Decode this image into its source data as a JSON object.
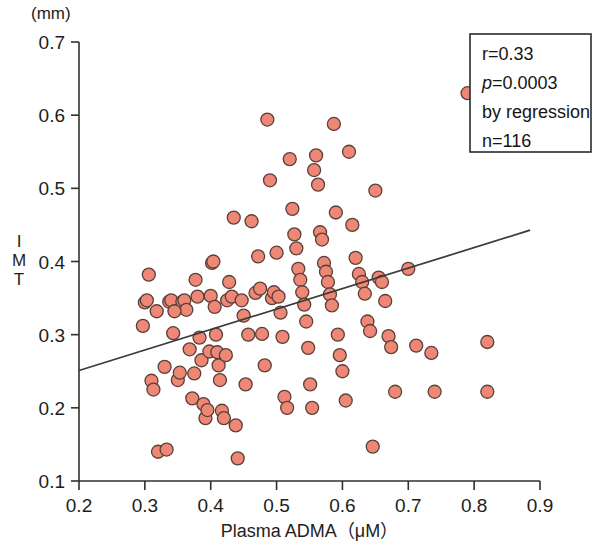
{
  "figure": {
    "unit_label": "(mm)",
    "y_axis_title_chars": [
      "I",
      "M",
      "T"
    ],
    "x_axis_title": "Plasma ADMA（μM）"
  },
  "legend": {
    "lines": [
      {
        "id": "r",
        "text": "r=0.33",
        "italic": false
      },
      {
        "id": "p",
        "text": "p=0.0003",
        "italic": true
      },
      {
        "id": "method",
        "text": "by regression",
        "italic": false
      },
      {
        "id": "n",
        "text": "n=116",
        "italic": false
      }
    ]
  },
  "chart_data": {
    "type": "scatter",
    "title": "",
    "xlabel": "Plasma ADMA（μM）",
    "ylabel": "IMT",
    "yunit": "(mm)",
    "xlim": [
      0.2,
      0.9
    ],
    "ylim": [
      0.1,
      0.7
    ],
    "xticks": [
      0.2,
      0.3,
      0.4,
      0.5,
      0.6,
      0.7,
      0.8,
      0.9
    ],
    "xticklabels": [
      "0.2",
      "0.3",
      "0.4",
      "0.5",
      "0.6",
      "0.7",
      "0.8",
      "0.9"
    ],
    "yticks": [
      0.1,
      0.2,
      0.3,
      0.4,
      0.5,
      0.6,
      0.7
    ],
    "yticklabels": [
      "0.1",
      "0.2",
      "0.3",
      "0.4",
      "0.5",
      "0.6",
      "0.7"
    ],
    "grid": false,
    "legend_position": "top-right",
    "marker": {
      "shape": "circle",
      "fill": "#EE8775",
      "edge": "#5A4038",
      "size_px": 13
    },
    "annotations": {
      "r": 0.33,
      "p": 0.0003,
      "n": 116,
      "method": "by regression"
    },
    "regression_line": {
      "x": [
        0.2,
        0.9
      ],
      "y": [
        0.251,
        0.447
      ],
      "color": "#3a3a3a",
      "drawn_x_range": [
        0.2,
        0.885
      ]
    },
    "points": [
      [
        0.297,
        0.312
      ],
      [
        0.3,
        0.344
      ],
      [
        0.303,
        0.347
      ],
      [
        0.306,
        0.382
      ],
      [
        0.31,
        0.237
      ],
      [
        0.313,
        0.225
      ],
      [
        0.318,
        0.332
      ],
      [
        0.32,
        0.14
      ],
      [
        0.33,
        0.256
      ],
      [
        0.333,
        0.143
      ],
      [
        0.337,
        0.345
      ],
      [
        0.34,
        0.347
      ],
      [
        0.343,
        0.302
      ],
      [
        0.35,
        0.238
      ],
      [
        0.353,
        0.248
      ],
      [
        0.357,
        0.345
      ],
      [
        0.36,
        0.347
      ],
      [
        0.363,
        0.334
      ],
      [
        0.368,
        0.28
      ],
      [
        0.372,
        0.213
      ],
      [
        0.375,
        0.247
      ],
      [
        0.377,
        0.375
      ],
      [
        0.38,
        0.352
      ],
      [
        0.383,
        0.296
      ],
      [
        0.386,
        0.265
      ],
      [
        0.389,
        0.205
      ],
      [
        0.392,
        0.186
      ],
      [
        0.395,
        0.197
      ],
      [
        0.398,
        0.277
      ],
      [
        0.4,
        0.353
      ],
      [
        0.402,
        0.398
      ],
      [
        0.404,
        0.4
      ],
      [
        0.406,
        0.338
      ],
      [
        0.408,
        0.3
      ],
      [
        0.41,
        0.276
      ],
      [
        0.412,
        0.258
      ],
      [
        0.414,
        0.238
      ],
      [
        0.417,
        0.196
      ],
      [
        0.42,
        0.186
      ],
      [
        0.423,
        0.272
      ],
      [
        0.425,
        0.347
      ],
      [
        0.428,
        0.372
      ],
      [
        0.432,
        0.352
      ],
      [
        0.435,
        0.46
      ],
      [
        0.438,
        0.176
      ],
      [
        0.441,
        0.131
      ],
      [
        0.447,
        0.347
      ],
      [
        0.45,
        0.326
      ],
      [
        0.453,
        0.232
      ],
      [
        0.457,
        0.3
      ],
      [
        0.462,
        0.455
      ],
      [
        0.468,
        0.357
      ],
      [
        0.472,
        0.407
      ],
      [
        0.475,
        0.363
      ],
      [
        0.478,
        0.301
      ],
      [
        0.482,
        0.258
      ],
      [
        0.486,
        0.594
      ],
      [
        0.49,
        0.511
      ],
      [
        0.493,
        0.35
      ],
      [
        0.496,
        0.358
      ],
      [
        0.5,
        0.412
      ],
      [
        0.503,
        0.352
      ],
      [
        0.506,
        0.33
      ],
      [
        0.509,
        0.297
      ],
      [
        0.512,
        0.215
      ],
      [
        0.516,
        0.2
      ],
      [
        0.52,
        0.54
      ],
      [
        0.524,
        0.472
      ],
      [
        0.527,
        0.437
      ],
      [
        0.53,
        0.418
      ],
      [
        0.533,
        0.39
      ],
      [
        0.536,
        0.375
      ],
      [
        0.539,
        0.358
      ],
      [
        0.542,
        0.341
      ],
      [
        0.545,
        0.318
      ],
      [
        0.548,
        0.282
      ],
      [
        0.551,
        0.232
      ],
      [
        0.554,
        0.2
      ],
      [
        0.557,
        0.525
      ],
      [
        0.56,
        0.545
      ],
      [
        0.563,
        0.505
      ],
      [
        0.566,
        0.44
      ],
      [
        0.569,
        0.43
      ],
      [
        0.572,
        0.398
      ],
      [
        0.575,
        0.386
      ],
      [
        0.578,
        0.372
      ],
      [
        0.581,
        0.355
      ],
      [
        0.584,
        0.34
      ],
      [
        0.587,
        0.588
      ],
      [
        0.59,
        0.467
      ],
      [
        0.593,
        0.3
      ],
      [
        0.596,
        0.272
      ],
      [
        0.6,
        0.25
      ],
      [
        0.605,
        0.21
      ],
      [
        0.61,
        0.55
      ],
      [
        0.615,
        0.45
      ],
      [
        0.62,
        0.405
      ],
      [
        0.625,
        0.383
      ],
      [
        0.63,
        0.372
      ],
      [
        0.634,
        0.356
      ],
      [
        0.638,
        0.318
      ],
      [
        0.642,
        0.305
      ],
      [
        0.646,
        0.147
      ],
      [
        0.65,
        0.497
      ],
      [
        0.655,
        0.378
      ],
      [
        0.66,
        0.372
      ],
      [
        0.665,
        0.346
      ],
      [
        0.67,
        0.298
      ],
      [
        0.674,
        0.283
      ],
      [
        0.68,
        0.222
      ],
      [
        0.7,
        0.39
      ],
      [
        0.712,
        0.285
      ],
      [
        0.735,
        0.275
      ],
      [
        0.74,
        0.222
      ],
      [
        0.79,
        0.63
      ],
      [
        0.82,
        0.29
      ],
      [
        0.82,
        0.222
      ],
      [
        0.345,
        0.332
      ]
    ]
  }
}
